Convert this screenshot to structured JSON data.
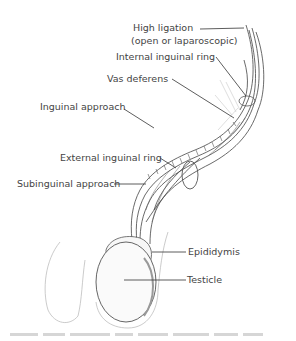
{
  "figure": {
    "labels": {
      "high_ligation": "High ligation",
      "high_ligation_sub": "(open or laparoscopic)",
      "internal_inguinal_ring": "Internal inguinal ring",
      "vas_deferens": "Vas deferens",
      "inguinal_approach": "Inguinal approach",
      "external_inguinal_ring": "External inguinal ring",
      "subinguinal_approach": "Subinguinal approach",
      "epididymis": "Epididymis",
      "testicle": "Testicle"
    },
    "colors": {
      "line": "#333333",
      "text": "#444444",
      "sketch": "#555555"
    }
  }
}
